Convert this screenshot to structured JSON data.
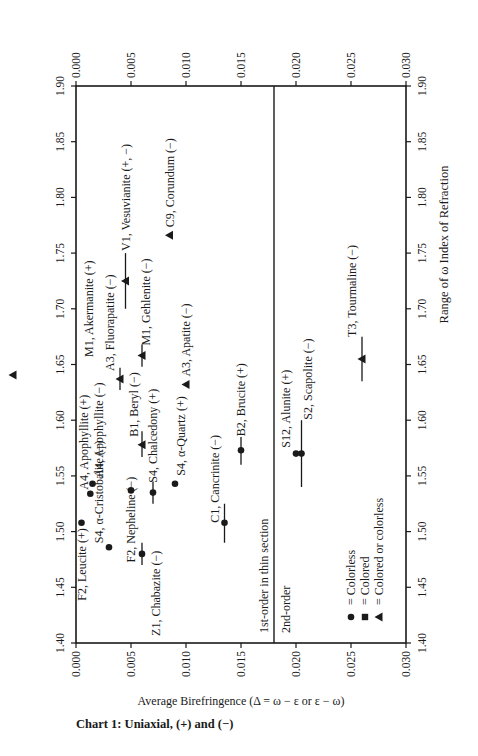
{
  "chart_data": {
    "type": "scatter",
    "title": "Chart 1: Uniaxial, (+) and (−)",
    "xlabel": "Range of ω Index of Refraction",
    "ylabel": "Average Birefringence (Δ = ω − ε or ε − ω)",
    "xlim": [
      1.4,
      1.9
    ],
    "ylim": [
      0.0,
      0.03
    ],
    "x_ticks": [
      "1.40",
      "1.45",
      "1.50",
      "1.55",
      "1.60",
      "1.65",
      "1.70",
      "1.75",
      "1.80",
      "1.85",
      "1.90"
    ],
    "y_ticks": [
      "0.000",
      "0.005",
      "0.010",
      "0.015",
      "0.020",
      "0.025",
      "0.030"
    ],
    "orientation": "rotated 90 degrees counter-clockwise on page",
    "divider": {
      "birefringence": 0.018,
      "label_below": "1st-order in thin section",
      "label_above": "2nd-order"
    },
    "legend": [
      {
        "marker": "circle",
        "label": "Colorless"
      },
      {
        "marker": "square",
        "label": "Colored"
      },
      {
        "marker": "triangle",
        "label": "Colored or colorless"
      }
    ],
    "points": [
      {
        "label": "F2, Leucite (+)",
        "n": 1.508,
        "biref": 0.0005,
        "marker": "circle"
      },
      {
        "label": "A4, Apophyllite (+)",
        "n": 1.534,
        "biref": 0.0013,
        "marker": "circle"
      },
      {
        "label": "A4, Apophyllite (−)",
        "n": 1.543,
        "biref": 0.0015,
        "marker": "circle"
      },
      {
        "label": "S4, α-Cristobalite (−)",
        "n": 1.486,
        "biref": 0.003,
        "marker": "circle"
      },
      {
        "label": "F2, Nepheline (−)",
        "n": 1.537,
        "biref": 0.005,
        "marker": "circle"
      },
      {
        "label": "Z1, Chabazite (−)",
        "n": 1.48,
        "biref": 0.006,
        "marker": "circle",
        "range": [
          1.47,
          1.49
        ]
      },
      {
        "label": "S4, Chalcedony (+)",
        "n": 1.535,
        "biref": 0.007,
        "marker": "circle",
        "range": [
          1.525,
          1.545
        ]
      },
      {
        "label": "S4, α-Quartz (+)",
        "n": 1.543,
        "biref": 0.009,
        "marker": "circle"
      },
      {
        "label": "B1, Beryl (−)",
        "n": 1.578,
        "biref": 0.006,
        "marker": "triangle",
        "range": [
          1.567,
          1.59
        ]
      },
      {
        "label": "A3, Fluorapatite (−)",
        "n": 1.637,
        "biref": 0.004,
        "marker": "triangle",
        "range": [
          1.627,
          1.647
        ]
      },
      {
        "label": "M1, Gehlenite (−)",
        "n": 1.658,
        "biref": 0.006,
        "marker": "triangle",
        "range": [
          1.648,
          1.668
        ]
      },
      {
        "label": "M1, Akermanite (+)",
        "n": 1.637,
        "biref": 0.003,
        "marker": "triangle"
      },
      {
        "label": "V1, Vesuvianite (+, −)",
        "n": 1.725,
        "biref": 0.0045,
        "marker": "triangle",
        "range": [
          1.7,
          1.75
        ]
      },
      {
        "label": "C9, Corundum (−)",
        "n": 1.766,
        "biref": 0.0085,
        "marker": "triangle"
      },
      {
        "label": "A3, Apatite (−)",
        "n": 1.632,
        "biref": 0.01,
        "marker": "triangle"
      },
      {
        "label": "C1, Cancrinite (−)",
        "n": 1.508,
        "biref": 0.0135,
        "marker": "circle",
        "range": [
          1.49,
          1.525
        ]
      },
      {
        "label": "B2, Brucite (+)",
        "n": 1.573,
        "biref": 0.015,
        "marker": "circle",
        "range": [
          1.56,
          1.585
        ]
      },
      {
        "label": "S12, Alunite (+)",
        "n": 1.57,
        "biref": 0.02,
        "marker": "circle"
      },
      {
        "label": "S2, Scapolite (−)",
        "n": 1.57,
        "biref": 0.0205,
        "marker": "circle",
        "range": [
          1.54,
          1.6
        ]
      },
      {
        "label": "T3, Tourmaline (−)",
        "n": 1.655,
        "biref": 0.026,
        "marker": "triangle",
        "range": [
          1.635,
          1.675
        ]
      }
    ]
  },
  "labels": {
    "title": "Chart 1: Uniaxial, (+) and (−)",
    "xlabel": "Range of ω Index of Refraction",
    "ylabel": "Average Birefringence (Δ = ω − ε or ε − ω)",
    "first_order": "1st-order in thin section",
    "second_order": "2nd-order",
    "legend_colorless": "= Colorless",
    "legend_colored": "= Colored",
    "legend_either": "= Colored or colorless"
  }
}
